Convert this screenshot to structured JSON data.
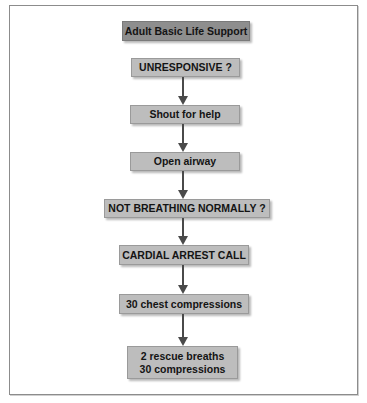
{
  "diagram": {
    "title": "Adult Basic Life Support",
    "steps": [
      {
        "label": "UNRESPONSIVE ?"
      },
      {
        "label": "Shout for help"
      },
      {
        "label": "Open airway"
      },
      {
        "label": "NOT BREATHING NORMALLY ?"
      },
      {
        "label": "CARDIAL ARREST CALL"
      },
      {
        "label": "30 chest compressions"
      },
      {
        "lines": [
          "2 rescue breaths",
          "30 compressions"
        ]
      }
    ],
    "colors": {
      "title_box": "#8e8e8e",
      "step_box": "#bdbdbd",
      "arrow": "#4a4a4a",
      "frame": "#8c8c8c"
    }
  }
}
